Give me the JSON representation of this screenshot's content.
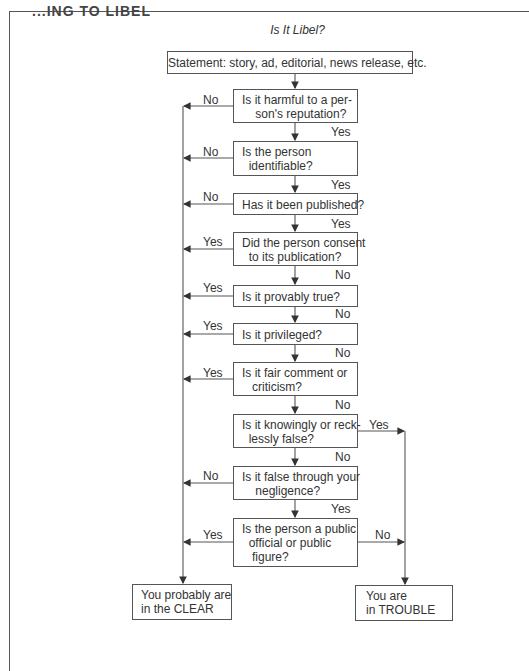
{
  "page": {
    "header_cut_text": "...ING TO LIBEL",
    "title": "Is It Libel?"
  },
  "flowchart": {
    "start": {
      "label": "Statement: story, ad, editorial, news release, etc."
    },
    "questions": [
      {
        "id": "q1",
        "text": "Is it harmful to a per-\n    son's reputation?",
        "left_label": "No",
        "down_label": "Yes"
      },
      {
        "id": "q2",
        "text": "Is the person\n  identifiable?",
        "left_label": "No",
        "down_label": "Yes"
      },
      {
        "id": "q3",
        "text": "Has it been published?",
        "left_label": "No",
        "down_label": "Yes"
      },
      {
        "id": "q4",
        "text": "Did the person consent\n  to its publication?",
        "left_label": "Yes",
        "down_label": "No"
      },
      {
        "id": "q5",
        "text": "Is it provably true?",
        "left_label": "Yes",
        "down_label": "No"
      },
      {
        "id": "q6",
        "text": "Is it privileged?",
        "left_label": "Yes",
        "down_label": "No"
      },
      {
        "id": "q7",
        "text": "Is it fair comment or\n   criticism?",
        "left_label": "Yes",
        "down_label": "No"
      },
      {
        "id": "q8",
        "text": "Is it knowingly or reck-\n  lessly false?",
        "right_label": "Yes",
        "down_label": "No"
      },
      {
        "id": "q9",
        "text": "Is it false through your\n    negligence?",
        "left_label": "No",
        "down_label": "Yes"
      },
      {
        "id": "q10",
        "text": "Is the person a public\n  official or public\n   figure?",
        "left_label": "Yes",
        "right_label": "No"
      }
    ],
    "outcomes": {
      "clear": "You probably are\nin the CLEAR",
      "trouble": "You are\nin TROUBLE"
    }
  },
  "colors": {
    "line": "#555555",
    "text": "#333333",
    "background": "#ffffff"
  }
}
